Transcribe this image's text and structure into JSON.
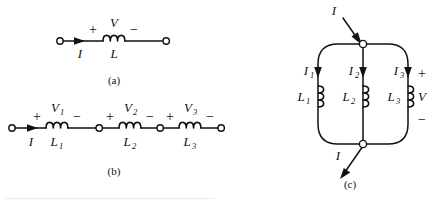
{
  "figure": {
    "background": "#ffffff",
    "ink": "#111111",
    "panels": [
      {
        "id": "panel-a",
        "caption": "(a)",
        "type": "single-inductor-series",
        "current_label": "I",
        "elements": [
          {
            "name": "inductor-1",
            "inductance_label": "L",
            "voltage_label": "V",
            "plus": "+",
            "minus": "−"
          }
        ]
      },
      {
        "id": "panel-b",
        "caption": "(b)",
        "type": "series-inductors",
        "current_label": "I",
        "elements": [
          {
            "name": "inductor-1",
            "inductance_label": "L",
            "inductance_sub": "1",
            "voltage_label": "V",
            "voltage_sub": "1",
            "plus": "+",
            "minus": "−"
          },
          {
            "name": "inductor-2",
            "inductance_label": "L",
            "inductance_sub": "2",
            "voltage_label": "V",
            "voltage_sub": "2",
            "plus": "+",
            "minus": "−"
          },
          {
            "name": "inductor-3",
            "inductance_label": "L",
            "inductance_sub": "3",
            "voltage_label": "V",
            "voltage_sub": "3",
            "plus": "+",
            "minus": "−"
          }
        ]
      },
      {
        "id": "panel-c",
        "caption": "(c)",
        "type": "parallel-inductors",
        "current_in_label": "I",
        "current_out_label": "I",
        "voltage_label": "V",
        "plus": "+",
        "minus": "−",
        "branches": [
          {
            "name": "branch-1",
            "current_label": "I",
            "current_sub": "1",
            "inductance_label": "L",
            "inductance_sub": "1"
          },
          {
            "name": "branch-2",
            "current_label": "I",
            "current_sub": "2",
            "inductance_label": "L",
            "inductance_sub": "2"
          },
          {
            "name": "branch-3",
            "current_label": "I",
            "current_sub": "3",
            "inductance_label": "L",
            "inductance_sub": "3"
          }
        ]
      }
    ],
    "footnote": "——————————————————————————————"
  }
}
